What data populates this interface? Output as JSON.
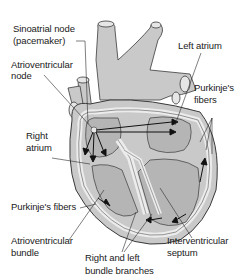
{
  "diagram": {
    "colors": {
      "tissue_outer": "#c9c9c9",
      "tissue_inner": "#b5b5b5",
      "pathway": "#e8e8e8",
      "outline": "#3a3a3a",
      "text": "#1a1a1a",
      "background": "#ffffff"
    },
    "labels": {
      "sa_node_line1": "Sinoatrial node",
      "sa_node_line2": "(pacemaker)",
      "av_node_line1": "Atrioventricular",
      "av_node_line2": "node",
      "left_atrium": "Left atrium",
      "purkinje_right_line1": "Purkinje's",
      "purkinje_right_line2": "fibers",
      "right_atrium_line1": "Right",
      "right_atrium_line2": "atrium",
      "purkinje_left": "Purkinje's fibers",
      "av_bundle_line1": "Atrioventricular",
      "av_bundle_line2": "bundle",
      "bundle_branches_line1": "Right and left",
      "bundle_branches_line2": "bundle branches",
      "septum_line1": "Interventricular",
      "septum_line2": "septum"
    }
  }
}
